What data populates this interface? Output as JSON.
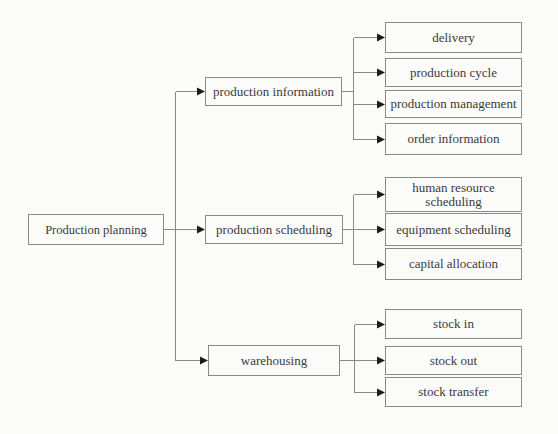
{
  "figure": {
    "type": "tree-diagram",
    "root": {
      "label": "Production planning"
    },
    "groups": [
      {
        "parent": {
          "label": "production information"
        },
        "children": [
          {
            "label": "delivery"
          },
          {
            "label": "production cycle"
          },
          {
            "label": "production management"
          },
          {
            "label": "order information"
          }
        ]
      },
      {
        "parent": {
          "label": "production scheduling"
        },
        "children": [
          {
            "label": "human resource scheduling"
          },
          {
            "label": "equipment scheduling"
          },
          {
            "label": "capital allocation"
          }
        ]
      },
      {
        "parent": {
          "label": "warehousing"
        },
        "children": [
          {
            "label": "stock in"
          },
          {
            "label": "stock out"
          },
          {
            "label": "stock transfer"
          }
        ]
      }
    ],
    "colors": {
      "background": "#fcfcfa",
      "box_border": "#8a8a8a",
      "text": "#3a3a3a",
      "line": "#8a8a8a",
      "arrow": "#1c1c1c"
    }
  }
}
